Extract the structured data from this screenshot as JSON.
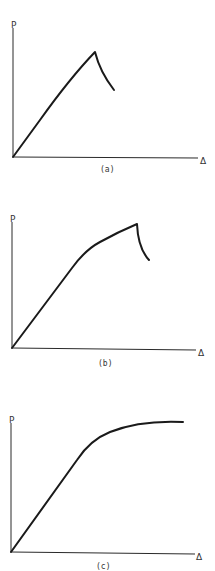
{
  "figures": [
    {
      "id": "a",
      "caption": "(a)",
      "y_axis_label": "P",
      "x_axis_label": "Δ",
      "description": "Linear rise to a sharp peak, then sudden drop in load"
    },
    {
      "id": "b",
      "caption": "(b)",
      "y_axis_label": "P",
      "x_axis_label": "Δ",
      "description": "Linear rise, then softening nonlinear segment to a peak, followed by sudden drop"
    },
    {
      "id": "c",
      "caption": "(c)",
      "y_axis_label": "P",
      "x_axis_label": "Δ",
      "description": "Linear rise, then softening curve approaching a plateau (ductile)"
    }
  ],
  "colors": {
    "background": "#ffffff",
    "line": "#1a1a1a",
    "axis": "#2a2a2a",
    "text": "#333333"
  }
}
